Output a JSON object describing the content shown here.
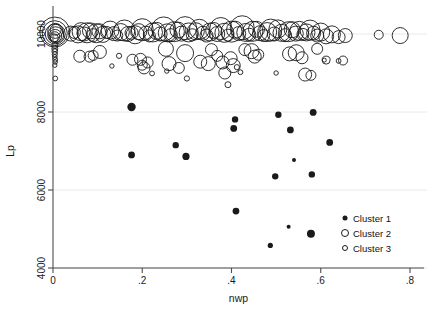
{
  "chart_data": {
    "type": "scatter",
    "title": "",
    "xlabel": "nwp",
    "ylabel": "Lp",
    "xlim": [
      -0.02,
      0.83
    ],
    "ylim": [
      4000,
      10600
    ],
    "xticks": [
      0,
      0.2,
      0.4,
      0.6,
      0.8
    ],
    "xticklabels": [
      "0",
      ".2",
      ".4",
      ".6",
      ".8"
    ],
    "yticks": [
      4000,
      6000,
      8000,
      10000
    ],
    "yticklabels": [
      "4000",
      "6000",
      "8000",
      "10000"
    ],
    "grid": "horizontal",
    "legend_position": "lower-right",
    "legend": [
      {
        "label": "Cluster 1",
        "marker": "filled-circle",
        "size": 5
      },
      {
        "label": "Cluster 2",
        "marker": "open-circle",
        "size": 7
      },
      {
        "label": "Cluster 3",
        "marker": "open-circle",
        "size": 5
      }
    ],
    "colors": {
      "marker": "#1a1a1a",
      "axis": "#4d4d4d",
      "grid": "#e8e8e8",
      "background": "#ffffff"
    },
    "note": "bubble scatter; marker radius encodes a third magnitude variable",
    "series": [
      {
        "name": "Cluster 1",
        "marker": "filled-circle",
        "points": [
          [
            0.176,
            8130,
            4.2
          ],
          [
            0.176,
            6900,
            3.4
          ],
          [
            0.275,
            7150,
            3.2
          ],
          [
            0.298,
            6860,
            3.6
          ],
          [
            0.405,
            7580,
            3.4
          ],
          [
            0.408,
            7810,
            3.2
          ],
          [
            0.41,
            5460,
            3.4
          ],
          [
            0.487,
            4580,
            2.6
          ],
          [
            0.498,
            6350,
            3.2
          ],
          [
            0.505,
            7930,
            3.2
          ],
          [
            0.528,
            5060,
            2.0
          ],
          [
            0.532,
            7540,
            3.4
          ],
          [
            0.54,
            6770,
            2.0
          ],
          [
            0.578,
            4880,
            4.0
          ],
          [
            0.58,
            6400,
            3.2
          ],
          [
            0.583,
            7990,
            3.4
          ],
          [
            0.62,
            7220,
            3.4
          ]
        ]
      },
      {
        "name": "Cluster 2",
        "marker": "open-circle",
        "points": [
          [
            0.004,
            10050,
            15.0
          ],
          [
            0.004,
            10020,
            12.5
          ],
          [
            0.005,
            10000,
            10.0
          ],
          [
            0.006,
            9980,
            8.0
          ],
          [
            0.005,
            9950,
            6.5
          ],
          [
            0.004,
            9930,
            5.0
          ],
          [
            0.005,
            10080,
            7.5
          ],
          [
            0.006,
            10110,
            5.5
          ],
          [
            0.003,
            9900,
            4.0
          ],
          [
            0.04,
            10010,
            7.5
          ],
          [
            0.048,
            10040,
            6.0
          ],
          [
            0.056,
            9990,
            8.5
          ],
          [
            0.063,
            10060,
            9.0
          ],
          [
            0.07,
            10000,
            7.0
          ],
          [
            0.076,
            10030,
            10.0
          ],
          [
            0.084,
            10080,
            8.0
          ],
          [
            0.09,
            9970,
            6.5
          ],
          [
            0.097,
            10020,
            9.5
          ],
          [
            0.104,
            10070,
            7.5
          ],
          [
            0.112,
            9990,
            8.0
          ],
          [
            0.12,
            10040,
            6.0
          ],
          [
            0.128,
            10100,
            9.0
          ],
          [
            0.136,
            10010,
            7.0
          ],
          [
            0.144,
            9960,
            5.5
          ],
          [
            0.152,
            10050,
            8.5
          ],
          [
            0.16,
            10090,
            10.5
          ],
          [
            0.168,
            10000,
            7.5
          ],
          [
            0.176,
            10030,
            6.5
          ],
          [
            0.184,
            9980,
            9.0
          ],
          [
            0.192,
            10060,
            8.0
          ],
          [
            0.2,
            10110,
            11.0
          ],
          [
            0.208,
            10020,
            7.0
          ],
          [
            0.216,
            9950,
            6.0
          ],
          [
            0.224,
            10040,
            9.5
          ],
          [
            0.232,
            10080,
            8.5
          ],
          [
            0.24,
            10000,
            7.0
          ],
          [
            0.248,
            10130,
            12.0
          ],
          [
            0.256,
            10030,
            9.0
          ],
          [
            0.264,
            9970,
            6.5
          ],
          [
            0.272,
            10060,
            10.0
          ],
          [
            0.28,
            10100,
            8.0
          ],
          [
            0.288,
            10010,
            7.5
          ],
          [
            0.296,
            10150,
            11.5
          ],
          [
            0.304,
            10040,
            9.5
          ],
          [
            0.312,
            9980,
            6.0
          ],
          [
            0.32,
            10070,
            8.5
          ],
          [
            0.328,
            10120,
            10.0
          ],
          [
            0.336,
            10020,
            7.0
          ],
          [
            0.344,
            9960,
            6.5
          ],
          [
            0.352,
            10050,
            9.0
          ],
          [
            0.36,
            10090,
            8.0
          ],
          [
            0.368,
            10000,
            7.5
          ],
          [
            0.376,
            10140,
            11.0
          ],
          [
            0.384,
            10030,
            9.5
          ],
          [
            0.392,
            9970,
            6.0
          ],
          [
            0.4,
            10060,
            10.5
          ],
          [
            0.408,
            10110,
            8.5
          ],
          [
            0.416,
            10010,
            7.0
          ],
          [
            0.424,
            10160,
            12.0
          ],
          [
            0.432,
            10040,
            9.0
          ],
          [
            0.44,
            9980,
            6.5
          ],
          [
            0.448,
            10070,
            10.0
          ],
          [
            0.456,
            10120,
            8.0
          ],
          [
            0.464,
            10020,
            7.5
          ],
          [
            0.472,
            9960,
            6.0
          ],
          [
            0.48,
            10050,
            9.5
          ],
          [
            0.488,
            10100,
            11.0
          ],
          [
            0.496,
            10000,
            7.0
          ],
          [
            0.504,
            10130,
            9.0
          ],
          [
            0.512,
            10030,
            8.5
          ],
          [
            0.52,
            9970,
            6.5
          ],
          [
            0.528,
            10060,
            10.0
          ],
          [
            0.536,
            10110,
            8.0
          ],
          [
            0.544,
            10010,
            7.5
          ],
          [
            0.552,
            10080,
            9.5
          ],
          [
            0.56,
            9990,
            6.0
          ],
          [
            0.568,
            10040,
            8.5
          ],
          [
            0.576,
            10100,
            10.0
          ],
          [
            0.584,
            10020,
            7.0
          ],
          [
            0.592,
            9960,
            6.5
          ],
          [
            0.6,
            10050,
            9.0
          ],
          [
            0.612,
            9940,
            7.5
          ],
          [
            0.625,
            9990,
            8.5
          ],
          [
            0.64,
            9920,
            6.5
          ],
          [
            0.655,
            9960,
            7.0
          ],
          [
            0.73,
            9980,
            4.5
          ],
          [
            0.778,
            9960,
            8.0
          ],
          [
            0.06,
            9430,
            6.0
          ],
          [
            0.082,
            9420,
            5.5
          ],
          [
            0.09,
            9450,
            5.0
          ],
          [
            0.105,
            9540,
            6.5
          ],
          [
            0.178,
            9340,
            5.5
          ],
          [
            0.196,
            9350,
            6.0
          ],
          [
            0.2,
            9200,
            5.0
          ],
          [
            0.212,
            9270,
            5.5
          ],
          [
            0.204,
            9130,
            6.0
          ],
          [
            0.253,
            9620,
            7.5
          ],
          [
            0.26,
            9240,
            7.0
          ],
          [
            0.282,
            9130,
            5.5
          ],
          [
            0.296,
            9510,
            8.5
          ],
          [
            0.33,
            9290,
            6.5
          ],
          [
            0.348,
            9240,
            7.0
          ],
          [
            0.355,
            9600,
            6.0
          ],
          [
            0.368,
            9440,
            5.5
          ],
          [
            0.38,
            9270,
            6.5
          ],
          [
            0.385,
            9000,
            6.0
          ],
          [
            0.398,
            9380,
            6.5
          ],
          [
            0.404,
            9190,
            7.0
          ],
          [
            0.43,
            9600,
            6.0
          ],
          [
            0.445,
            9560,
            7.5
          ],
          [
            0.452,
            9420,
            6.5
          ],
          [
            0.46,
            9470,
            5.5
          ],
          [
            0.53,
            9490,
            7.0
          ],
          [
            0.545,
            9520,
            8.0
          ],
          [
            0.558,
            9390,
            6.0
          ],
          [
            0.565,
            8960,
            6.5
          ],
          [
            0.578,
            8940,
            5.0
          ],
          [
            0.592,
            9620,
            5.5
          ],
          [
            0.612,
            9330,
            4.0
          ],
          [
            0.65,
            9320,
            4.5
          ]
        ]
      },
      {
        "name": "Cluster 3",
        "marker": "open-circle",
        "points": [
          [
            0.004,
            9700,
            3.0
          ],
          [
            0.004,
            9620,
            3.0
          ],
          [
            0.004,
            9550,
            2.8
          ],
          [
            0.004,
            9480,
            2.6
          ],
          [
            0.004,
            9410,
            2.4
          ],
          [
            0.005,
            9340,
            2.4
          ],
          [
            0.005,
            9280,
            2.2
          ],
          [
            0.004,
            9200,
            2.2
          ],
          [
            0.005,
            8860,
            2.4
          ],
          [
            0.132,
            9180,
            2.2
          ],
          [
            0.148,
            9440,
            2.6
          ],
          [
            0.222,
            8990,
            2.4
          ],
          [
            0.255,
            9050,
            2.2
          ],
          [
            0.3,
            8860,
            2.6
          ],
          [
            0.392,
            8700,
            3.0
          ],
          [
            0.412,
            9150,
            2.6
          ],
          [
            0.42,
            9020,
            2.4
          ],
          [
            0.5,
            9000,
            2.2
          ],
          [
            0.608,
            9330,
            2.0
          ],
          [
            0.64,
            9310,
            2.4
          ]
        ]
      }
    ]
  },
  "legend_box": {
    "items": [
      "Cluster 1",
      "Cluster 2",
      "Cluster 3"
    ]
  }
}
